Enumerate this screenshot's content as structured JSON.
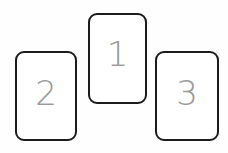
{
  "canvas": {
    "width": 228,
    "height": 153,
    "background_color": "#fefefe",
    "description": "Three rounded rectangle cards arranged in a staggered row, each labeled with a numeral"
  },
  "style": {
    "card_border_color": "#1c1c1c",
    "card_fill_color": "#ffffff",
    "numeral_color": "#9a9a9a",
    "card_border_width_px": 2,
    "card_corner_radius_px": 9
  },
  "cards": [
    {
      "id": "card-1",
      "label": "1",
      "position": "center",
      "x": 88,
      "y": 13,
      "width": 59,
      "height": 91
    },
    {
      "id": "card-2",
      "label": "2",
      "position": "left",
      "x": 15,
      "y": 51,
      "width": 62,
      "height": 90
    },
    {
      "id": "card-3",
      "label": "3",
      "position": "right",
      "x": 155,
      "y": 51,
      "width": 64,
      "height": 90
    }
  ]
}
